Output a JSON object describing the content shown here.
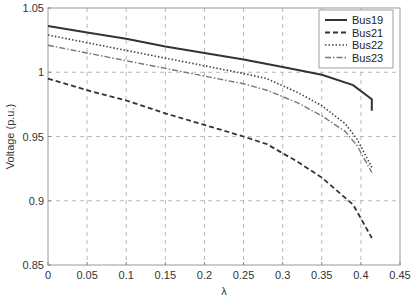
{
  "chart_data": {
    "type": "line",
    "title": "",
    "xlabel": "λ",
    "ylabel": "Voltage (p.u.)",
    "xlim": [
      0,
      0.45
    ],
    "ylim": [
      0.85,
      1.05
    ],
    "xticks": [
      "0",
      "0.05",
      "0.1",
      "0.15",
      "0.2",
      "0.25",
      "0.3",
      "0.35",
      "0.4",
      "0.45"
    ],
    "yticks": [
      "0.85",
      "0.9",
      "0.95",
      "1",
      "1.05"
    ],
    "grid": true,
    "legend_position": "upper right",
    "series": [
      {
        "name": "Bus19",
        "style": "solid",
        "color": "#333333",
        "x": [
          0,
          0.05,
          0.1,
          0.15,
          0.2,
          0.25,
          0.3,
          0.35,
          0.39,
          0.414,
          0.414
        ],
        "y": [
          1.036,
          1.031,
          1.026,
          1.02,
          1.015,
          1.01,
          1.004,
          0.998,
          0.99,
          0.979,
          0.97
        ]
      },
      {
        "name": "Bus21",
        "style": "dashed",
        "color": "#333333",
        "x": [
          0,
          0.05,
          0.1,
          0.15,
          0.2,
          0.25,
          0.28,
          0.32,
          0.35,
          0.39,
          0.414
        ],
        "y": [
          0.995,
          0.986,
          0.978,
          0.968,
          0.959,
          0.95,
          0.944,
          0.93,
          0.918,
          0.897,
          0.871
        ]
      },
      {
        "name": "Bus22",
        "style": "dotted",
        "color": "#444444",
        "x": [
          0,
          0.05,
          0.1,
          0.15,
          0.2,
          0.25,
          0.28,
          0.32,
          0.35,
          0.38,
          0.395,
          0.414
        ],
        "y": [
          1.029,
          1.023,
          1.017,
          1.011,
          1.005,
          0.999,
          0.995,
          0.984,
          0.974,
          0.96,
          0.948,
          0.926
        ]
      },
      {
        "name": "Bus23",
        "style": "dashdot",
        "color": "#777777",
        "x": [
          0,
          0.05,
          0.1,
          0.15,
          0.2,
          0.25,
          0.28,
          0.32,
          0.35,
          0.38,
          0.395,
          0.414
        ],
        "y": [
          1.021,
          1.015,
          1.009,
          1.003,
          0.997,
          0.991,
          0.986,
          0.976,
          0.966,
          0.954,
          0.943,
          0.922
        ]
      }
    ]
  }
}
